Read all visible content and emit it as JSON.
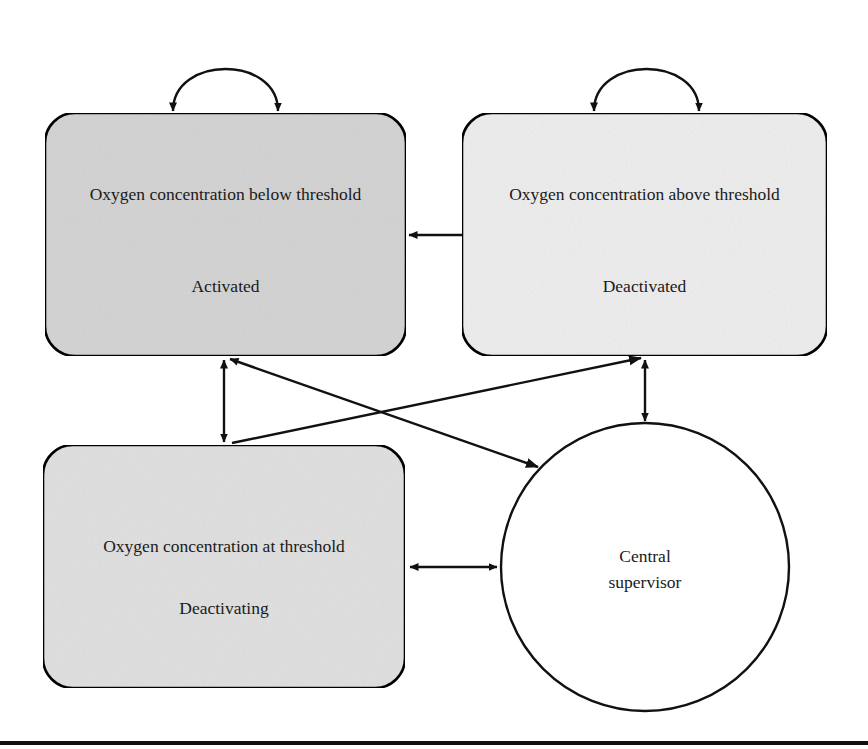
{
  "diagram": {
    "type": "state-transition",
    "nodes": [
      {
        "id": "below",
        "shape": "rounded-rect",
        "title": "Oxygen concentration below threshold",
        "state": "Activated",
        "fill": "#d6d6d6",
        "x": 45,
        "y": 113,
        "w": 361,
        "h": 243
      },
      {
        "id": "above",
        "shape": "rounded-rect",
        "title": "Oxygen concentration above threshold",
        "state": "Deactivated",
        "fill": "#efefef",
        "x": 462,
        "y": 113,
        "w": 365,
        "h": 243
      },
      {
        "id": "at",
        "shape": "rounded-rect",
        "title": "Oxygen concentration at threshold",
        "state": "Deactivating",
        "fill": "#e2e2e2",
        "x": 43,
        "y": 445,
        "w": 362,
        "h": 243
      },
      {
        "id": "supervisor",
        "shape": "circle",
        "line1": "Central",
        "line2": "supervisor",
        "fill": "#ffffff",
        "cx": 645,
        "cy": 567,
        "r": 144
      }
    ],
    "edges": [
      {
        "from": "below",
        "to": "below",
        "kind": "self-loop",
        "direction": "both-ends"
      },
      {
        "from": "above",
        "to": "above",
        "kind": "self-loop",
        "direction": "both-ends"
      },
      {
        "from": "above",
        "to": "below",
        "direction": "one-way"
      },
      {
        "from": "below",
        "to": "at",
        "direction": "bidirectional"
      },
      {
        "from": "below",
        "to": "supervisor",
        "direction": "bidirectional"
      },
      {
        "from": "at",
        "to": "above",
        "direction": "one-way"
      },
      {
        "from": "above",
        "to": "supervisor",
        "direction": "bidirectional"
      },
      {
        "from": "at",
        "to": "supervisor",
        "direction": "bidirectional"
      }
    ],
    "colors": {
      "stroke": "#111111",
      "text": "#1a1a1a",
      "background": "#ffffff"
    }
  }
}
